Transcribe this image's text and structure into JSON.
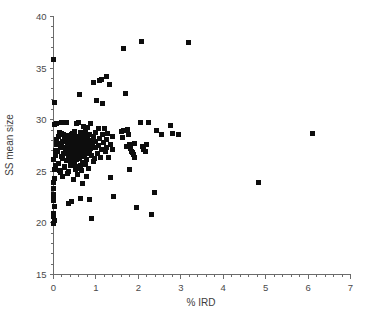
{
  "figure": {
    "title": "",
    "x_axis_label": "% IRD",
    "y_axis_label": "SS mean size"
  },
  "chart_data": {
    "type": "scatter",
    "title": "",
    "xlabel": "% IRD",
    "ylabel": "SS mean size",
    "xlim": [
      0,
      7
    ],
    "ylim": [
      15,
      40
    ],
    "xticks": [
      0,
      1,
      2,
      3,
      4,
      5,
      6,
      7
    ],
    "xtick_labels": [
      "0",
      "1",
      "2",
      "3",
      "4",
      "5",
      "6",
      "7"
    ],
    "yticks": [
      15,
      20,
      25,
      30,
      35,
      40
    ],
    "ytick_labels": [
      "15",
      "20",
      "25",
      "30",
      "35",
      "40"
    ],
    "x_minor_tick_step": 0.2,
    "y_minor_tick_step": 1,
    "grid": false,
    "legend": null,
    "marker": {
      "shape": "square",
      "color": "#0d0d0d",
      "size_px": 5
    },
    "n_points": 208,
    "points": [
      [
        0.0,
        35.85
      ],
      [
        0.03,
        31.65
      ],
      [
        0.02,
        29.55
      ],
      [
        0.0,
        26.15
      ],
      [
        0.0,
        23.95
      ],
      [
        0.0,
        23.3
      ],
      [
        0.0,
        22.75
      ],
      [
        0.0,
        22.45
      ],
      [
        0.0,
        22.15
      ],
      [
        0.02,
        21.6
      ],
      [
        0.0,
        20.95
      ],
      [
        0.0,
        20.6
      ],
      [
        0.02,
        20.25
      ],
      [
        0.0,
        19.9
      ],
      [
        0.03,
        25.15
      ],
      [
        0.03,
        24.35
      ],
      [
        0.04,
        27.05
      ],
      [
        0.05,
        26.55
      ],
      [
        0.06,
        28.05
      ],
      [
        0.05,
        25.6
      ],
      [
        0.08,
        27.55
      ],
      [
        0.1,
        26.95
      ],
      [
        0.12,
        28.35
      ],
      [
        0.14,
        25.1
      ],
      [
        0.16,
        27.35
      ],
      [
        0.18,
        26.4
      ],
      [
        0.2,
        29.75
      ],
      [
        0.2,
        28.7
      ],
      [
        0.22,
        27.85
      ],
      [
        0.22,
        24.5
      ],
      [
        0.24,
        26.7
      ],
      [
        0.26,
        28.15
      ],
      [
        0.26,
        25.35
      ],
      [
        0.28,
        27.2
      ],
      [
        0.3,
        29.7
      ],
      [
        0.3,
        26.05
      ],
      [
        0.32,
        27.65
      ],
      [
        0.34,
        28.45
      ],
      [
        0.34,
        24.8
      ],
      [
        0.36,
        26.3
      ],
      [
        0.36,
        21.9
      ],
      [
        0.38,
        27.95
      ],
      [
        0.4,
        27.1
      ],
      [
        0.4,
        25.55
      ],
      [
        0.42,
        28.6
      ],
      [
        0.42,
        22.05
      ],
      [
        0.44,
        26.8
      ],
      [
        0.45,
        27.45
      ],
      [
        0.46,
        24.2
      ],
      [
        0.47,
        28.2
      ],
      [
        0.48,
        25.9
      ],
      [
        0.49,
        27.0
      ],
      [
        0.5,
        28.9
      ],
      [
        0.5,
        26.5
      ],
      [
        0.51,
        27.7
      ],
      [
        0.52,
        25.2
      ],
      [
        0.53,
        28.4
      ],
      [
        0.54,
        27.25
      ],
      [
        0.55,
        26.1
      ],
      [
        0.55,
        29.65
      ],
      [
        0.56,
        27.9
      ],
      [
        0.57,
        24.65
      ],
      [
        0.58,
        28.05
      ],
      [
        0.58,
        26.85
      ],
      [
        0.59,
        27.5
      ],
      [
        0.6,
        29.7
      ],
      [
        0.6,
        25.45
      ],
      [
        0.61,
        28.3
      ],
      [
        0.62,
        27.15
      ],
      [
        0.62,
        26.25
      ],
      [
        0.63,
        28.75
      ],
      [
        0.64,
        22.35
      ],
      [
        0.65,
        27.8
      ],
      [
        0.66,
        26.6
      ],
      [
        0.66,
        25.05
      ],
      [
        0.67,
        28.5
      ],
      [
        0.68,
        27.3
      ],
      [
        0.69,
        23.85
      ],
      [
        0.7,
        29.35
      ],
      [
        0.7,
        26.95
      ],
      [
        0.71,
        28.15
      ],
      [
        0.72,
        27.6
      ],
      [
        0.73,
        25.75
      ],
      [
        0.74,
        26.4
      ],
      [
        0.75,
        28.85
      ],
      [
        0.76,
        27.05
      ],
      [
        0.77,
        24.45
      ],
      [
        0.78,
        26.15
      ],
      [
        0.79,
        27.75
      ],
      [
        0.8,
        29.2
      ],
      [
        0.8,
        28.25
      ],
      [
        0.81,
        26.7
      ],
      [
        0.82,
        27.4
      ],
      [
        0.83,
        25.3
      ],
      [
        0.84,
        28.55
      ],
      [
        0.85,
        26.95
      ],
      [
        0.86,
        22.25
      ],
      [
        0.87,
        27.2
      ],
      [
        0.88,
        29.6
      ],
      [
        0.88,
        28.0
      ],
      [
        0.89,
        26.5
      ],
      [
        0.9,
        20.45
      ],
      [
        0.92,
        27.65
      ],
      [
        0.94,
        25.95
      ],
      [
        0.95,
        33.6
      ],
      [
        0.95,
        28.35
      ],
      [
        0.96,
        26.25
      ],
      [
        0.98,
        27.3
      ],
      [
        1.0,
        28.8
      ],
      [
        1.0,
        27.9
      ],
      [
        1.02,
        31.85
      ],
      [
        1.03,
        26.75
      ],
      [
        1.05,
        29.15
      ],
      [
        1.06,
        27.5
      ],
      [
        1.08,
        33.8
      ],
      [
        1.08,
        28.2
      ],
      [
        1.1,
        26.3
      ],
      [
        1.12,
        27.1
      ],
      [
        1.14,
        33.85
      ],
      [
        1.15,
        28.6
      ],
      [
        1.16,
        31.6
      ],
      [
        1.18,
        27.75
      ],
      [
        1.2,
        29.1
      ],
      [
        1.22,
        26.9
      ],
      [
        1.24,
        34.15
      ],
      [
        1.25,
        28.05
      ],
      [
        1.26,
        27.35
      ],
      [
        1.28,
        28.7
      ],
      [
        1.3,
        26.35
      ],
      [
        1.32,
        33.45
      ],
      [
        1.34,
        27.6
      ],
      [
        1.35,
        24.4
      ],
      [
        1.38,
        28.4
      ],
      [
        1.4,
        27.15
      ],
      [
        1.42,
        22.55
      ],
      [
        0.62,
        32.4
      ],
      [
        1.6,
        28.9
      ],
      [
        1.62,
        28.25
      ],
      [
        1.64,
        36.9
      ],
      [
        1.66,
        28.95
      ],
      [
        1.7,
        32.55
      ],
      [
        1.72,
        27.45
      ],
      [
        1.74,
        29.05
      ],
      [
        1.76,
        28.55
      ],
      [
        1.78,
        27.6
      ],
      [
        1.8,
        25.15
      ],
      [
        1.82,
        27.25
      ],
      [
        1.84,
        26.95
      ],
      [
        1.86,
        26.8
      ],
      [
        1.88,
        26.6
      ],
      [
        1.9,
        26.3
      ],
      [
        1.92,
        27.7
      ],
      [
        1.95,
        21.45
      ],
      [
        2.05,
        29.7
      ],
      [
        2.08,
        37.6
      ],
      [
        2.1,
        27.4
      ],
      [
        2.12,
        27.15
      ],
      [
        2.18,
        26.95
      ],
      [
        2.2,
        27.55
      ],
      [
        2.25,
        29.7
      ],
      [
        2.3,
        20.8
      ],
      [
        2.38,
        22.95
      ],
      [
        2.42,
        28.95
      ],
      [
        2.55,
        28.6
      ],
      [
        2.75,
        29.45
      ],
      [
        2.8,
        28.7
      ],
      [
        2.95,
        28.6
      ],
      [
        3.18,
        37.45
      ],
      [
        4.82,
        23.95
      ],
      [
        6.1,
        28.65
      ],
      [
        0.06,
        29.65
      ],
      [
        0.11,
        25.75
      ],
      [
        0.15,
        28.8
      ],
      [
        0.17,
        24.9
      ],
      [
        0.19,
        27.65
      ],
      [
        0.21,
        26.25
      ],
      [
        0.23,
        28.55
      ],
      [
        0.25,
        27.3
      ],
      [
        0.27,
        25.5
      ],
      [
        0.29,
        26.85
      ],
      [
        0.31,
        28.25
      ],
      [
        0.33,
        27.45
      ],
      [
        0.35,
        24.95
      ],
      [
        0.37,
        26.65
      ],
      [
        0.39,
        28.05
      ],
      [
        0.41,
        27.55
      ],
      [
        0.43,
        25.85
      ],
      [
        0.445,
        26.45
      ],
      [
        0.455,
        28.7
      ],
      [
        0.465,
        27.15
      ],
      [
        0.475,
        26.05
      ],
      [
        0.485,
        27.85
      ],
      [
        0.495,
        28.45
      ],
      [
        0.505,
        25.65
      ],
      [
        0.515,
        26.95
      ],
      [
        0.525,
        27.35
      ],
      [
        0.535,
        28.1
      ],
      [
        0.545,
        26.55
      ],
      [
        0.565,
        27.7
      ],
      [
        0.575,
        25.25
      ],
      [
        0.585,
        28.35
      ],
      [
        0.595,
        27.05
      ],
      [
        0.605,
        26.75
      ],
      [
        0.615,
        27.95
      ],
      [
        0.625,
        25.55
      ],
      [
        0.635,
        28.6
      ],
      [
        0.645,
        27.25
      ],
      [
        0.655,
        26.45
      ],
      [
        0.675,
        27.85
      ],
      [
        0.685,
        28.25
      ],
      [
        0.695,
        25.85
      ],
      [
        0.705,
        27.45
      ],
      [
        0.715,
        26.65
      ],
      [
        0.745,
        28.45
      ],
      [
        0.755,
        27.0
      ],
      [
        0.765,
        25.65
      ],
      [
        0.785,
        26.85
      ],
      [
        0.795,
        27.55
      ]
    ]
  }
}
